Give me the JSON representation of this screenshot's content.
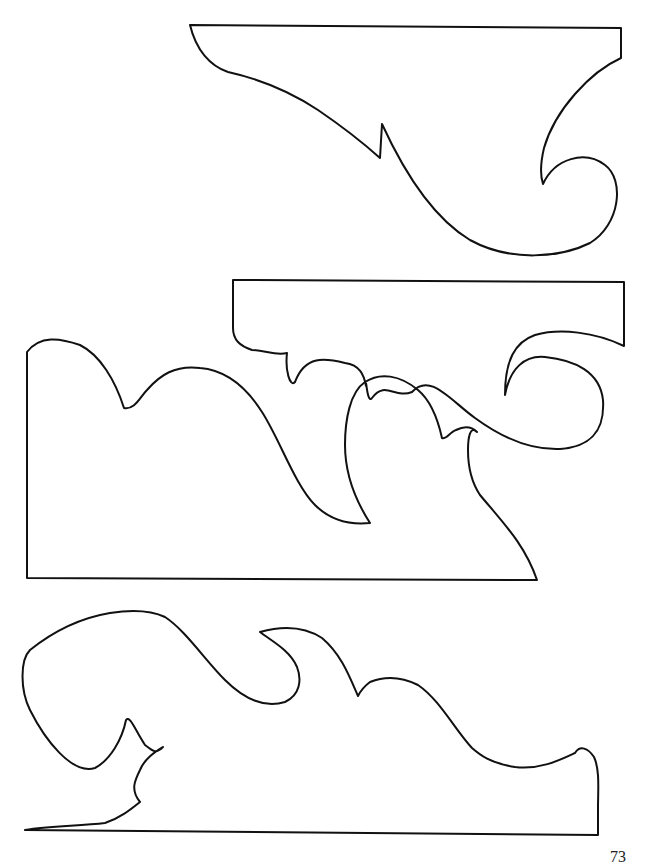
{
  "page": {
    "page_number": "73",
    "stroke_color": "#111111",
    "background_color": "#ffffff"
  },
  "patterns": [
    {
      "name": "top-bracket",
      "position": "top-right"
    },
    {
      "name": "middle-scroll-bracket",
      "position": "middle-right"
    },
    {
      "name": "large-wave-bracket",
      "position": "middle-left"
    },
    {
      "name": "bottom-scroll-bracket",
      "position": "bottom"
    }
  ]
}
